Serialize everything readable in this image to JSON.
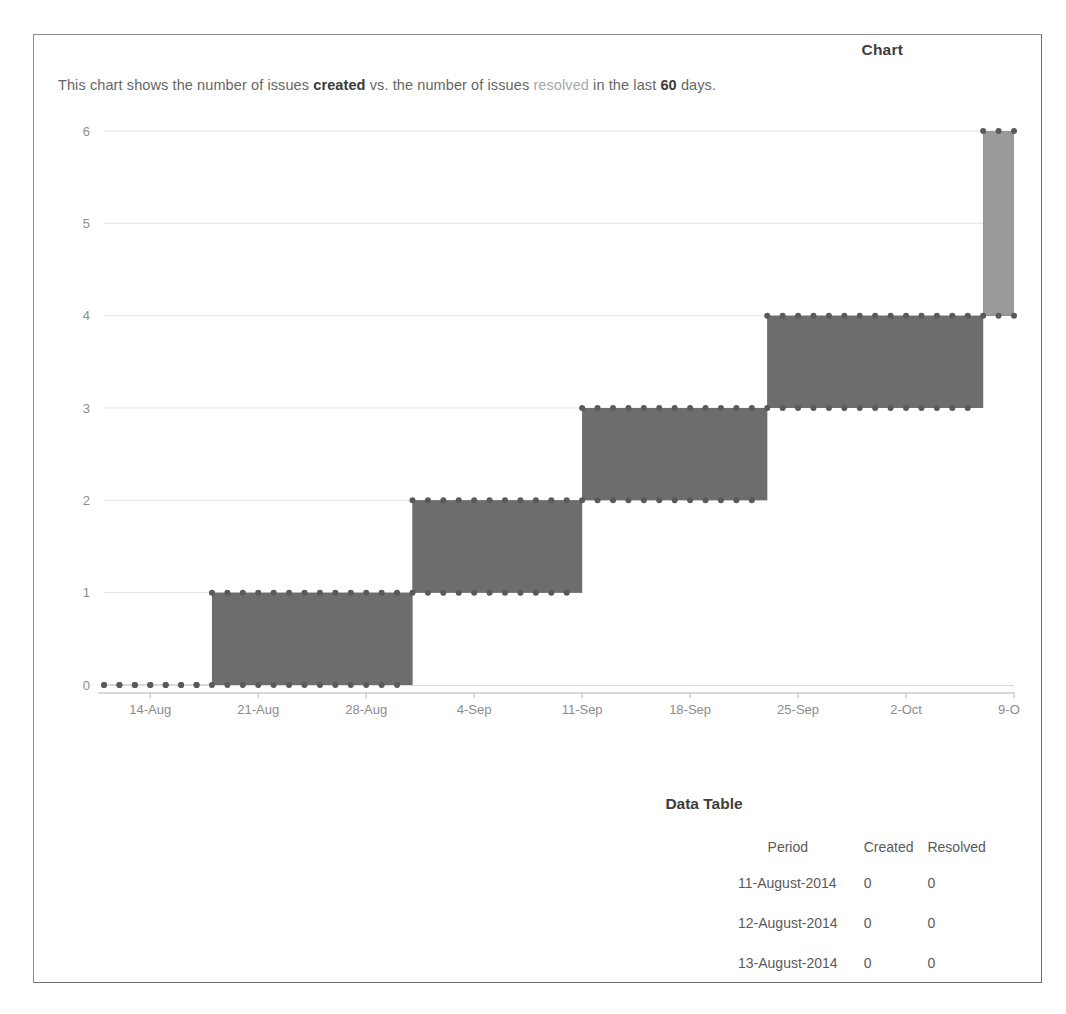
{
  "gadget": {
    "title": "Chart",
    "description": {
      "prefix": "This chart shows the number of issues ",
      "created_word": "created",
      "middle": " vs. the number of issues ",
      "resolved_word": "resolved",
      "suffix_before_days": " in the last ",
      "days": "60",
      "suffix": " days."
    }
  },
  "data_table": {
    "title": "Data Table",
    "columns": [
      "Period",
      "Created",
      "Resolved"
    ],
    "rows": [
      {
        "period": "11-August-2014",
        "created": "0",
        "resolved": "0"
      },
      {
        "period": "12-August-2014",
        "created": "0",
        "resolved": "0"
      },
      {
        "period": "13-August-2014",
        "created": "0",
        "resolved": "0"
      }
    ]
  },
  "colors": {
    "created_fill": "#9a9a9a",
    "resolved_fill": "#6d6d6d",
    "gridline": "#e2e2e2",
    "axis": "#b4b4b4",
    "tick_label": "#8c8c8c",
    "marker": "#5a5a5a"
  },
  "chart_data": {
    "type": "area",
    "title": "Chart",
    "subtitle": "This chart shows the number of issues created vs. the number of issues resolved in the last 60 days.",
    "xlabel": "",
    "ylabel": "",
    "ylim": [
      0,
      6
    ],
    "yticks": [
      0,
      1,
      2,
      3,
      4,
      5,
      6
    ],
    "ytick_labels": [
      "0",
      "1",
      "2",
      "3",
      "4",
      "5",
      "6"
    ],
    "xticks": [
      "14-Aug",
      "21-Aug",
      "28-Aug",
      "4-Sep",
      "11-Sep",
      "18-Sep",
      "25-Sep",
      "2-Oct",
      "9-Oct"
    ],
    "x_start": "11-Aug",
    "x_end": "10-Oct",
    "grid": true,
    "legend_position": "none",
    "step_style": "post",
    "markers": true,
    "series": [
      {
        "name": "created",
        "fill": "#9a9a9a",
        "x": [
          "11-Aug",
          "12-Aug",
          "13-Aug",
          "14-Aug",
          "15-Aug",
          "16-Aug",
          "17-Aug",
          "18-Aug",
          "19-Aug",
          "20-Aug",
          "21-Aug",
          "22-Aug",
          "23-Aug",
          "24-Aug",
          "25-Aug",
          "26-Aug",
          "27-Aug",
          "28-Aug",
          "29-Aug",
          "30-Aug",
          "31-Aug",
          "1-Sep",
          "2-Sep",
          "3-Sep",
          "4-Sep",
          "5-Sep",
          "6-Sep",
          "7-Sep",
          "8-Sep",
          "9-Sep",
          "10-Sep",
          "11-Sep",
          "12-Sep",
          "13-Sep",
          "14-Sep",
          "15-Sep",
          "16-Sep",
          "17-Sep",
          "18-Sep",
          "19-Sep",
          "20-Sep",
          "21-Sep",
          "22-Sep",
          "23-Sep",
          "24-Sep",
          "25-Sep",
          "26-Sep",
          "27-Sep",
          "28-Sep",
          "29-Sep",
          "30-Sep",
          "1-Oct",
          "2-Oct",
          "3-Oct",
          "4-Oct",
          "5-Oct",
          "6-Oct",
          "7-Oct",
          "8-Oct",
          "9-Oct"
        ],
        "values": [
          0,
          0,
          0,
          0,
          0,
          0,
          0,
          1,
          1,
          1,
          1,
          1,
          1,
          1,
          1,
          1,
          1,
          1,
          1,
          1,
          2,
          2,
          2,
          2,
          2,
          2,
          2,
          2,
          2,
          2,
          2,
          3,
          3,
          3,
          3,
          3,
          3,
          3,
          3,
          3,
          3,
          3,
          3,
          4,
          4,
          4,
          4,
          4,
          4,
          4,
          4,
          4,
          4,
          4,
          4,
          4,
          4,
          6,
          6,
          6
        ]
      },
      {
        "name": "resolved",
        "fill": "#6d6d6d",
        "x": [
          "11-Aug",
          "12-Aug",
          "13-Aug",
          "14-Aug",
          "15-Aug",
          "16-Aug",
          "17-Aug",
          "18-Aug",
          "19-Aug",
          "20-Aug",
          "21-Aug",
          "22-Aug",
          "23-Aug",
          "24-Aug",
          "25-Aug",
          "26-Aug",
          "27-Aug",
          "28-Aug",
          "29-Aug",
          "30-Aug",
          "31-Aug",
          "1-Sep",
          "2-Sep",
          "3-Sep",
          "4-Sep",
          "5-Sep",
          "6-Sep",
          "7-Sep",
          "8-Sep",
          "9-Sep",
          "10-Sep",
          "11-Sep",
          "12-Sep",
          "13-Sep",
          "14-Sep",
          "15-Sep",
          "16-Sep",
          "17-Sep",
          "18-Sep",
          "19-Sep",
          "20-Sep",
          "21-Sep",
          "22-Sep",
          "23-Sep",
          "24-Sep",
          "25-Sep",
          "26-Sep",
          "27-Sep",
          "28-Sep",
          "29-Sep",
          "30-Sep",
          "1-Oct",
          "2-Oct",
          "3-Oct",
          "4-Oct",
          "5-Oct",
          "6-Oct",
          "7-Oct",
          "8-Oct",
          "9-Oct"
        ],
        "values": [
          0,
          0,
          0,
          0,
          0,
          0,
          0,
          0,
          0,
          0,
          0,
          0,
          0,
          0,
          0,
          0,
          0,
          0,
          0,
          0,
          1,
          1,
          1,
          1,
          1,
          1,
          1,
          1,
          1,
          1,
          1,
          2,
          2,
          2,
          2,
          2,
          2,
          2,
          2,
          2,
          2,
          2,
          2,
          3,
          3,
          3,
          3,
          3,
          3,
          3,
          3,
          3,
          3,
          3,
          3,
          3,
          3,
          4,
          4,
          4
        ]
      }
    ]
  }
}
